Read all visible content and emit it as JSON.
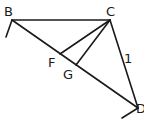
{
  "diagram": {
    "points": {
      "B": {
        "label": "B",
        "x": 12,
        "y": 20
      },
      "C": {
        "label": "C",
        "x": 110,
        "y": 20
      },
      "D": {
        "label": "D",
        "x": 138,
        "y": 108
      },
      "F": {
        "label": "F",
        "x": 60,
        "y": 54
      },
      "G": {
        "label": "G",
        "x": 76,
        "y": 65
      }
    },
    "segments": [
      [
        "B",
        "C"
      ],
      [
        "B",
        "D"
      ],
      [
        "C",
        "D"
      ],
      [
        "C",
        "F"
      ],
      [
        "C",
        "G"
      ]
    ],
    "edge_labels": [
      {
        "text": "1",
        "on": "CD"
      }
    ],
    "stroke_color": "#1a1a1a"
  }
}
